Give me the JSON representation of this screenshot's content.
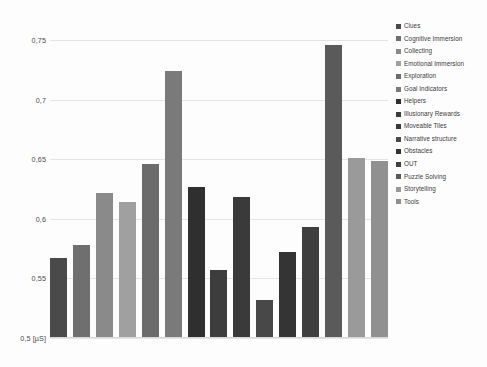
{
  "chart_data": {
    "type": "bar",
    "title": "",
    "xlabel": "",
    "ylabel": "0,5 [µS]",
    "ylim": [
      0.5,
      0.765
    ],
    "grid": true,
    "legend_position": "right",
    "y_ticks": [
      "0,75",
      "0,7",
      "0,65",
      "0,6",
      "0,55",
      "0,5 [µS]"
    ],
    "y_tick_values": [
      0.75,
      0.7,
      0.65,
      0.6,
      0.55,
      0.5
    ],
    "categories": [
      "Clues",
      "Cognitive Immersion",
      "Collecting",
      "Emotional Immersion",
      "Exploration",
      "Goal Indicators",
      "Helpers",
      "Illusionary Rewards",
      "Moveable Tiles",
      "Narrative structure",
      "Obstacles",
      "OUT",
      "Puzzle Solving",
      "Storytelling",
      "Tools"
    ],
    "values": [
      0.566,
      0.577,
      0.621,
      0.613,
      0.645,
      0.723,
      0.626,
      0.556,
      0.617,
      0.531,
      0.571,
      0.592,
      0.745,
      0.65,
      0.648
    ],
    "colors": [
      "#4a4a4a",
      "#6f6f6f",
      "#8a8a8a",
      "#a0a0a0",
      "#6b6b6b",
      "#7a7a7a",
      "#2f2f2f",
      "#3d3d3d",
      "#3a3a3a",
      "#484848",
      "#343434",
      "#3f3f3f",
      "#5a5a5a",
      "#9a9a9a",
      "#909090"
    ]
  },
  "legend": {
    "items": [
      {
        "label": "Clues",
        "color": "#4a4a4a"
      },
      {
        "label": "Cognitive Immersion",
        "color": "#6f6f6f"
      },
      {
        "label": "Collecting",
        "color": "#8a8a8a"
      },
      {
        "label": "Emotional Immersion",
        "color": "#a0a0a0"
      },
      {
        "label": "Exploration",
        "color": "#6b6b6b"
      },
      {
        "label": "Goal Indicators",
        "color": "#7a7a7a"
      },
      {
        "label": "Helpers",
        "color": "#2f2f2f"
      },
      {
        "label": "Illusionary Rewards",
        "color": "#3d3d3d"
      },
      {
        "label": "Moveable Tiles",
        "color": "#3a3a3a"
      },
      {
        "label": "Narrative structure",
        "color": "#484848"
      },
      {
        "label": "Obstacles",
        "color": "#343434"
      },
      {
        "label": "OUT",
        "color": "#3f3f3f"
      },
      {
        "label": "Puzzle Solving",
        "color": "#5a5a5a"
      },
      {
        "label": "Storytelling",
        "color": "#9a9a9a"
      },
      {
        "label": "Tools",
        "color": "#909090"
      }
    ]
  }
}
